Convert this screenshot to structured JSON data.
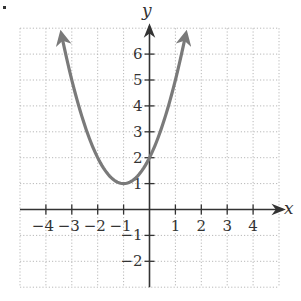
{
  "chart_data": {
    "type": "line",
    "title": "",
    "function": "y = (x + 1)^2 + 1",
    "xlabel": "x",
    "ylabel": "y",
    "xlim": [
      -5,
      5
    ],
    "ylim": [
      -3,
      7
    ],
    "grid": true,
    "grid_style": "dotted",
    "x_ticks": [
      -4,
      -3,
      -2,
      -1,
      1,
      2,
      3,
      4
    ],
    "x_tick_labels": [
      "−4",
      "−3",
      "−2",
      "−1",
      "1",
      "2",
      "3",
      "4"
    ],
    "y_ticks": [
      -2,
      -1,
      1,
      2,
      3,
      4,
      5,
      6
    ],
    "y_tick_labels": [
      "−2",
      "−1",
      "1",
      "2",
      "3",
      "4",
      "5",
      "6"
    ],
    "series": [
      {
        "name": "parabola",
        "color": "#7a7a7a",
        "x": [
          -3.4,
          -3,
          -2.5,
          -2,
          -1.5,
          -1,
          -0.5,
          0,
          0.5,
          1,
          1.4
        ],
        "y": [
          6.76,
          5,
          3.25,
          2,
          1.25,
          1,
          1.25,
          2,
          3.25,
          5,
          6.76
        ],
        "vertex": [
          -1,
          1
        ],
        "y_intercept": [
          0,
          2
        ],
        "arrows_both_ends": true
      }
    ],
    "colors": {
      "curve": "#7a7a7a",
      "axes": "#333333",
      "grid": "#b8b8b8"
    }
  }
}
